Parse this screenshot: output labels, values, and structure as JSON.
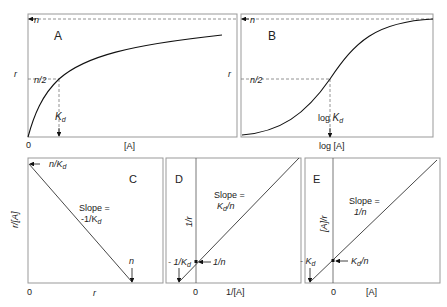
{
  "panels": {
    "A": {
      "letter": "A",
      "ylabel": "r",
      "xlabel": "[A]",
      "origin": "0",
      "tick_n": "n",
      "tick_half": "n/2",
      "kd": "K",
      "kd_sub": "d"
    },
    "B": {
      "letter": "B",
      "ylabel": "r",
      "xlabel": "log [A]",
      "tick_n": "n",
      "tick_half": "n/2",
      "logkd": "log ",
      "kd": "K",
      "kd_sub": "d"
    },
    "C": {
      "letter": "C",
      "ylabel": "r/[A]",
      "xlabel": "r",
      "origin": "0",
      "intercept_y": "n/K",
      "intercept_y_sub": "d",
      "intercept_x": "n",
      "slope_line1": "Slope =",
      "slope_line2": "-1/K",
      "slope_sub": "d"
    },
    "D": {
      "letter": "D",
      "ylabel": "1/r",
      "xlabel": "1/[A]",
      "origin": "0",
      "intercept_x": "- 1/K",
      "intercept_x_sub": "d",
      "intercept_y": "1/n",
      "slope_line1": "Slope =",
      "slope_line2a": "K",
      "slope_sub": "d",
      "slope_line2b": "/n"
    },
    "E": {
      "letter": "E",
      "ylabel": "[A]/r",
      "xlabel": "[A]",
      "origin": "0",
      "intercept_x": "- K",
      "intercept_x_sub": "d",
      "intercept_y_a": "K",
      "intercept_y_sub": "d",
      "intercept_y_b": "/n",
      "slope_line1": "Slope =",
      "slope_line2": "1/n"
    }
  }
}
